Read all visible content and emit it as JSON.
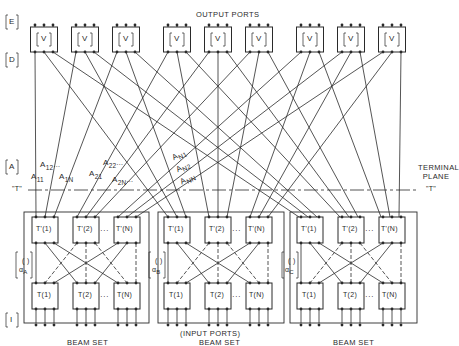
{
  "labels": {
    "output_ports": "OUTPUT PORTS",
    "input_ports": "(INPUT PORTS)",
    "terminal_plane_line1": "TERMINAL",
    "terminal_plane_line2": "PLANE",
    "terminal_left": "\"T\"",
    "terminal_right": "\"T\"",
    "row_E": "E",
    "row_D": "D",
    "row_A": "A",
    "row_I": "I"
  },
  "v_box_label": "V",
  "v_boxes_count": 9,
  "coupling_labels": [
    "A11",
    "A12",
    "A1N",
    "A21",
    "A22",
    "A2N",
    "AN1",
    "AN2",
    "ANN"
  ],
  "coupling_display": {
    "a11": {
      "main": "A",
      "sub": "11"
    },
    "a12": {
      "main": "A",
      "sub": "12"
    },
    "a1n": {
      "main": "A",
      "sub": "1N"
    },
    "a21": {
      "main": "A",
      "sub": "21"
    },
    "a22": {
      "main": "A",
      "sub": "22"
    },
    "a2n": {
      "main": "A",
      "sub": "2N"
    },
    "an1": {
      "main": "A",
      "sub": "N1"
    },
    "an2": {
      "main": "A",
      "sub": "N2"
    },
    "ann": {
      "main": "A",
      "sub": "NN"
    },
    "ellipsis": "..."
  },
  "beam_sets": [
    {
      "label": "BEAM SET",
      "alpha_sub": "A",
      "top_boxes": [
        "T'(1)",
        "T'(2)",
        "T'(N)"
      ],
      "bottom_boxes": [
        "T(1)",
        "T(2)",
        "T(N)"
      ]
    },
    {
      "label": "BEAM SET",
      "alpha_sub": "B",
      "top_boxes": [
        "T'(1)",
        "T'(2)",
        "T'(N)"
      ],
      "bottom_boxes": [
        "T(1)",
        "T(2)",
        "T(N)"
      ]
    },
    {
      "label": "BEAM SET",
      "alpha_sub": "C",
      "top_boxes": [
        "T'(1)",
        "T'(2)",
        "T'(N)"
      ],
      "bottom_boxes": [
        "T(1)",
        "T(2)",
        "T(N)"
      ]
    }
  ],
  "box_text": {
    "t_prime_1": "T'(1)",
    "t_prime_2": "T'(2)",
    "t_prime_n": "T'(N)",
    "t_1": "T(1)",
    "t_2": "T(2)",
    "t_n": "T(N)",
    "alpha": "α",
    "alpha_paren": "( )",
    "dots": "···"
  },
  "colors": {
    "ink": "#2a2a2a",
    "background": "#ffffff"
  }
}
